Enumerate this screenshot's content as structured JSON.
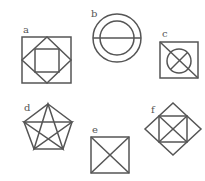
{
  "figures": {
    "a": {
      "label": "a",
      "description": "square containing a rotated square (diamond) containing a smaller square"
    },
    "b": {
      "label": "b",
      "description": "two concentric circles with a horizontal diameter"
    },
    "c": {
      "label": "c",
      "description": "square with a diagonal and an inscribed circle containing a cross"
    },
    "d": {
      "label": "d",
      "description": "regular pentagon with all diagonals (pentagram)"
    },
    "e": {
      "label": "e",
      "description": "square with both diagonals"
    },
    "f": {
      "label": "f",
      "description": "diamond containing a square with both diagonals"
    }
  },
  "colors": {
    "stroke": "#555555",
    "background": "#ffffff"
  }
}
